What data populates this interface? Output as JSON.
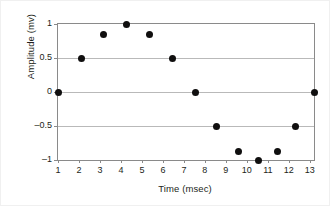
{
  "chart_data": {
    "type": "scatter",
    "title": "",
    "xlabel": "Time (msec)",
    "ylabel": "Amplitude (mv)",
    "xlim": [
      1,
      13.2
    ],
    "ylim": [
      -1,
      1
    ],
    "xticks": [
      1,
      2,
      3,
      4,
      5,
      6,
      7,
      8,
      9,
      10,
      11,
      12,
      13
    ],
    "xticklabels": [
      "1",
      "2",
      "3",
      "4",
      "5",
      "6",
      "7",
      "8",
      "9",
      "10",
      "11",
      "12",
      "13"
    ],
    "yticks": [
      -1,
      -0.5,
      0,
      0.5,
      1
    ],
    "yticklabels": [
      "–1",
      "–0.5",
      "0",
      "0.5",
      "1"
    ],
    "grid": "horizontal",
    "legend": "none",
    "marker_color": "#100f0f",
    "grid_color": "#b9b9b9",
    "frame_color": "#8a8a8a",
    "series": [
      {
        "name": "amplitude",
        "points": [
          {
            "x": 1.0,
            "y": 0.0
          },
          {
            "x": 2.1,
            "y": 0.5
          },
          {
            "x": 3.15,
            "y": 0.85
          },
          {
            "x": 4.25,
            "y": 1.0
          },
          {
            "x": 5.35,
            "y": 0.85
          },
          {
            "x": 6.45,
            "y": 0.5
          },
          {
            "x": 7.55,
            "y": 0.0
          },
          {
            "x": 8.55,
            "y": -0.51
          },
          {
            "x": 9.6,
            "y": -0.88
          },
          {
            "x": 10.55,
            "y": -1.0
          },
          {
            "x": 11.45,
            "y": -0.88
          },
          {
            "x": 12.3,
            "y": -0.51
          },
          {
            "x": 13.2,
            "y": 0.0
          }
        ]
      }
    ]
  }
}
